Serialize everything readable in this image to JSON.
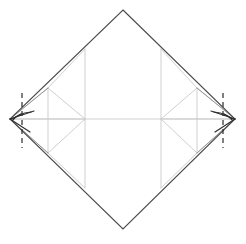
{
  "figure": {
    "kind": "origami-fold-diagram",
    "canvas": {
      "width": 246,
      "height": 244,
      "background": "#ffffff"
    }
  },
  "styles": {
    "outline_color": "#4a4a4a",
    "outline_width": 1.1,
    "crease_color": "#c9c9c9",
    "crease_width": 0.9,
    "fold_line_color": "#3a3a3a",
    "fold_line_width": 1.0,
    "dash_color": "#2b2b2b",
    "dash_width": 1.2,
    "dash_pattern": "5,4",
    "arrow_color": "#2b2b2b",
    "arrow_width": 1.2
  },
  "geometry": {
    "sheet_label": "main-diamond",
    "vertices": {
      "top": {
        "x": 123,
        "y": 10
      },
      "right": {
        "x": 235,
        "y": 119
      },
      "bottom": {
        "x": 123,
        "y": 229
      },
      "left": {
        "x": 10,
        "y": 119
      }
    },
    "outline_path": "M123,10 L235,119 L123,229 L10,119 Z",
    "center_horizontal": {
      "x1": 10,
      "y1": 119,
      "x2": 235,
      "y2": 119
    },
    "inner_vertical_left": {
      "x": 85,
      "y1": 49,
      "y2": 188
    },
    "inner_vertical_right": {
      "x": 161,
      "y1": 49,
      "y2": 188
    },
    "left_group": {
      "label": "left-flap-assembly",
      "vertical": {
        "x": 48,
        "y1": 88,
        "y2": 153
      },
      "diamond_path": "M48,88 L85,119 L48,153 L10,119 Z",
      "diag_upper": {
        "x1": 48,
        "y1": 88,
        "x2": 85,
        "y2": 119
      },
      "diag_lower": {
        "x1": 48,
        "y1": 153,
        "x2": 85,
        "y2": 119
      },
      "tip_upper": {
        "x1": 10,
        "y1": 119,
        "x2": 48,
        "y2": 88
      },
      "tip_lower": {
        "x1": 10,
        "y1": 119,
        "x2": 48,
        "y2": 153
      },
      "fold_tri_path": "M10,119 L33,112 L27,130 Z",
      "fold_tri_top": {
        "x1": 10,
        "y1": 119,
        "x2": 33,
        "y2": 112
      },
      "fold_tri_bottom": {
        "x1": 10,
        "y1": 119,
        "x2": 30,
        "y2": 131
      },
      "dash_line": {
        "x": 22,
        "y1": 93,
        "y2": 148
      },
      "arrow_path": "M31,112 Q18,113 13,120",
      "arrow_head": "M13,120 L20,115 L19,121 Z"
    },
    "right_group": {
      "label": "right-flap-assembly",
      "vertical": {
        "x": 197,
        "y1": 88,
        "y2": 153
      },
      "diamond_path": "M197,88 L161,119 L197,153 L235,119 Z",
      "diag_upper": {
        "x1": 197,
        "y1": 88,
        "x2": 161,
        "y2": 119
      },
      "diag_lower": {
        "x1": 197,
        "y1": 153,
        "x2": 161,
        "y2": 119
      },
      "tip_upper": {
        "x1": 235,
        "y1": 119,
        "x2": 197,
        "y2": 88
      },
      "tip_lower": {
        "x1": 235,
        "y1": 119,
        "x2": 197,
        "y2": 153
      },
      "fold_tri_path": "M235,119 L212,112 L218,130 Z",
      "fold_tri_top": {
        "x1": 235,
        "y1": 119,
        "x2": 212,
        "y2": 112
      },
      "fold_tri_bottom": {
        "x1": 235,
        "y1": 119,
        "x2": 215,
        "y2": 131
      },
      "dash_line": {
        "x": 223,
        "y1": 93,
        "y2": 148
      },
      "arrow_path": "M214,112 Q227,113 232,120",
      "arrow_head": "M232,120 L225,115 L226,121 Z"
    },
    "inner_creases": [
      {
        "name": "crease-upper-left-diag",
        "x1": 85,
        "y1": 49,
        "x2": 48,
        "y2": 88
      },
      {
        "name": "crease-lower-left-diag",
        "x1": 85,
        "y1": 188,
        "x2": 48,
        "y2": 153
      },
      {
        "name": "crease-upper-right-diag",
        "x1": 161,
        "y1": 49,
        "x2": 197,
        "y2": 88
      },
      {
        "name": "crease-lower-right-diag",
        "x1": 161,
        "y1": 188,
        "x2": 197,
        "y2": 153
      },
      {
        "name": "crease-left-center-up",
        "x1": 85,
        "y1": 49,
        "x2": 85,
        "y2": 119
      },
      {
        "name": "crease-left-center-down",
        "x1": 85,
        "y1": 119,
        "x2": 85,
        "y2": 188
      }
    ]
  },
  "labels": {
    "left_dash_name": "left-mountain-fold-line",
    "right_dash_name": "right-mountain-fold-line",
    "left_arrow_name": "left-fold-arrow",
    "right_arrow_name": "right-fold-arrow"
  }
}
